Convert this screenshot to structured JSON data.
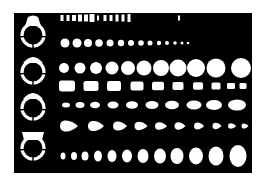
{
  "stencil": {
    "description": "Jewelry design template stencil",
    "colors": {
      "plate": "#000000",
      "cutout": "#ffffff",
      "background": "#ffffff"
    },
    "plate": {
      "x": 14,
      "y": 13,
      "width": 238,
      "height": 160
    },
    "rings": [
      {
        "name": "ring-profile-1",
        "cx": 33,
        "cy": 34,
        "style": "rounded-top"
      },
      {
        "name": "ring-profile-2",
        "cx": 33,
        "cy": 71,
        "style": "dome-top"
      },
      {
        "name": "ring-profile-3",
        "cx": 33,
        "cy": 107,
        "style": "dome-top"
      },
      {
        "name": "ring-profile-4",
        "cx": 33,
        "cy": 147,
        "style": "flat-prong-top"
      }
    ],
    "rows": [
      {
        "name": "baguette-slots",
        "shape": "rect",
        "cy": 18,
        "items": [
          [
            62,
            1.5,
            3
          ],
          [
            68,
            1.5,
            3
          ],
          [
            74,
            2,
            3
          ],
          [
            80,
            2,
            3.5
          ],
          [
            86,
            2,
            3.5
          ],
          [
            92,
            2.5,
            4
          ],
          [
            98,
            1,
            2.5
          ],
          [
            105,
            1.5,
            3
          ],
          [
            111,
            1.5,
            3
          ],
          [
            117,
            1.5,
            3.5
          ],
          [
            123,
            1.5,
            3.5
          ],
          [
            129,
            1.5,
            4
          ],
          [
            179,
            1,
            2.5
          ]
        ]
      },
      {
        "name": "small-round-row",
        "shape": "circle",
        "cy": 43,
        "items": [
          [
            65,
            4.5
          ],
          [
            77,
            4.5
          ],
          [
            88,
            4
          ],
          [
            99,
            3.8
          ],
          [
            110,
            3.5
          ],
          [
            121,
            3.2
          ],
          [
            131,
            3
          ],
          [
            141,
            2.8
          ],
          [
            150,
            2.5
          ],
          [
            159,
            2.2
          ],
          [
            167,
            2
          ],
          [
            175,
            1.8
          ],
          [
            182,
            1.5
          ],
          [
            188,
            1.3
          ]
        ]
      },
      {
        "name": "large-round-row",
        "shape": "circle",
        "cy": 68,
        "items": [
          [
            64,
            5
          ],
          [
            80,
            5.5
          ],
          [
            96,
            6
          ],
          [
            112,
            6.5
          ],
          [
            128,
            7
          ],
          [
            144,
            7.5
          ],
          [
            161,
            8
          ],
          [
            178,
            8.5
          ],
          [
            196,
            9
          ],
          [
            216,
            9.5
          ],
          [
            241,
            10
          ]
        ]
      },
      {
        "name": "cushion-row",
        "shape": "roundrect",
        "cy": 86,
        "items": [
          [
            67,
            8,
            5.5
          ],
          [
            91,
            7.5,
            5
          ],
          [
            114,
            7,
            5
          ],
          [
            137,
            6.5,
            4.5
          ],
          [
            158,
            6,
            4.2
          ],
          [
            178,
            5.5,
            4
          ],
          [
            198,
            5,
            3.8
          ],
          [
            216,
            4.5,
            3.5
          ],
          [
            231,
            4,
            3
          ],
          [
            243,
            3.5,
            3
          ]
        ]
      },
      {
        "name": "marquise-row",
        "shape": "ellipse",
        "cy": 105,
        "items": [
          [
            66,
            4,
            2.5
          ],
          [
            80,
            4.5,
            3
          ],
          [
            95,
            5,
            3.2
          ],
          [
            113,
            5.5,
            3.5
          ],
          [
            132,
            6,
            3.8
          ],
          [
            152,
            6.5,
            4
          ],
          [
            172,
            7,
            4.2
          ],
          [
            194,
            7.5,
            4.5
          ],
          [
            214,
            8,
            5
          ],
          [
            237,
            9,
            5.5
          ]
        ]
      },
      {
        "name": "pear-row",
        "shape": "pear",
        "cy": 126,
        "items": [
          [
            69,
            9,
            6
          ],
          [
            96,
            8,
            5.5
          ],
          [
            120,
            7,
            5
          ],
          [
            141,
            6.5,
            4.5
          ],
          [
            161,
            6,
            4.2
          ],
          [
            180,
            5.5,
            4
          ],
          [
            199,
            5,
            3.8
          ],
          [
            217,
            4.5,
            3.5
          ],
          [
            232,
            4,
            3
          ],
          [
            245,
            3.5,
            2.8
          ]
        ]
      },
      {
        "name": "oval-row",
        "shape": "ellipse",
        "cy": 156,
        "items": [
          [
            63,
            2.5,
            3.5
          ],
          [
            74,
            3,
            4
          ],
          [
            85,
            3.5,
            4.5
          ],
          [
            98,
            4,
            5.5
          ],
          [
            112,
            4.5,
            6
          ],
          [
            127,
            5,
            6.5
          ],
          [
            143,
            5.5,
            7
          ],
          [
            160,
            6,
            7.5
          ],
          [
            177,
            6.5,
            8
          ],
          [
            196,
            7,
            8.5
          ],
          [
            216,
            7.5,
            9.5
          ],
          [
            238,
            8.5,
            11
          ]
        ]
      }
    ]
  }
}
